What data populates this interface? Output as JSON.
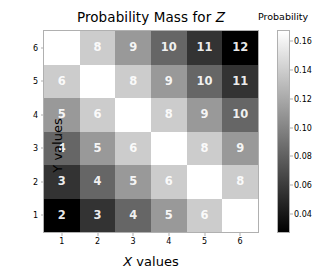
{
  "figure": {
    "title_prefix": "Probability Mass for ",
    "title_variable": "Z",
    "title_full": "Probability Mass for Z"
  },
  "axes": {
    "xlabel_variable": "X",
    "xlabel_suffix": " values",
    "xlabel_full": "X values",
    "ylabel": "Y values",
    "xticks": [
      "1",
      "2",
      "3",
      "4",
      "5",
      "6"
    ],
    "yticks": [
      "1",
      "2",
      "3",
      "4",
      "5",
      "6"
    ]
  },
  "colorbar": {
    "title": "Probability",
    "ticks": [
      "0.16",
      "0.14",
      "0.12",
      "0.10",
      "0.08",
      "0.06",
      "0.04"
    ],
    "vmin": 0.0278,
    "vmax": 0.1667,
    "cmap": "gray",
    "high_color": "#ffffff",
    "low_color": "#000000"
  },
  "chart_data": {
    "type": "heatmap",
    "title": "Probability Mass for Z",
    "xlabel": "X values",
    "ylabel": "Y values",
    "x": [
      1,
      2,
      3,
      4,
      5,
      6
    ],
    "y": [
      1,
      2,
      3,
      4,
      5,
      6
    ],
    "grid": false,
    "legend": "colorbar-right",
    "colorbar_label": "Probability",
    "annotation_note": "Cell annotation is Z = X + Y; cell color encodes the probability mass of that Z value.",
    "cell_labels": [
      [
        "7",
        "8",
        "9",
        "10",
        "11",
        "12"
      ],
      [
        "6",
        "7",
        "8",
        "9",
        "10",
        "11"
      ],
      [
        "5",
        "6",
        "7",
        "8",
        "9",
        "10"
      ],
      [
        "4",
        "5",
        "6",
        "7",
        "8",
        "9"
      ],
      [
        "3",
        "4",
        "5",
        "6",
        "7",
        "8"
      ],
      [
        "2",
        "3",
        "4",
        "5",
        "6",
        "7"
      ]
    ],
    "row_y_values": [
      6,
      5,
      4,
      3,
      2,
      1
    ],
    "values": [
      [
        0.1667,
        0.1389,
        0.1111,
        0.0833,
        0.0556,
        0.0278
      ],
      [
        0.1389,
        0.1667,
        0.1389,
        0.1111,
        0.0833,
        0.0556
      ],
      [
        0.1111,
        0.1389,
        0.1667,
        0.1389,
        0.1111,
        0.0833
      ],
      [
        0.0833,
        0.1111,
        0.1389,
        0.1667,
        0.1389,
        0.1111
      ],
      [
        0.0556,
        0.0833,
        0.1111,
        0.1389,
        0.1667,
        0.1389
      ],
      [
        0.0278,
        0.0556,
        0.0833,
        0.1111,
        0.1389,
        0.1667
      ]
    ],
    "zlim": [
      0.0278,
      0.1667
    ]
  }
}
